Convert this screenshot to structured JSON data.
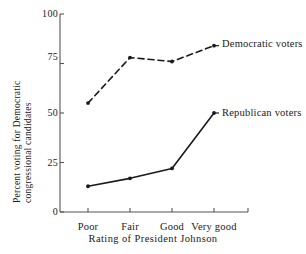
{
  "chart_data": {
    "type": "line",
    "title": "",
    "xlabel": "Rating of President Johnson",
    "ylabel": "Percent voting for Democratic congressional candidates",
    "ylabel_line1": "Percent voting for Democratic",
    "ylabel_line2": "congressional candidates",
    "categories": [
      "Poor",
      "Fair",
      "Good",
      "Very good"
    ],
    "ylim": [
      0,
      100
    ],
    "yticks": [
      0,
      25,
      50,
      75,
      100
    ],
    "ytick_labels": [
      "0",
      "25",
      "50",
      "75",
      "100"
    ],
    "grid": false,
    "legend_position": "inline-right",
    "series": [
      {
        "name": "Democratic voters",
        "style": "dashed",
        "marker": "dot",
        "color": "#1a1a1a",
        "values": [
          55,
          78,
          76,
          84
        ]
      },
      {
        "name": "Republican voters",
        "style": "solid",
        "marker": "dot",
        "color": "#1a1a1a",
        "values": [
          13,
          17,
          22,
          50
        ]
      }
    ]
  },
  "annotations": {
    "democratic_label": "Democratic voters",
    "republican_label": "Republican voters"
  },
  "colors": {
    "ink": "#1a1a1a",
    "axis": "#555555",
    "background": "#ffffff"
  }
}
